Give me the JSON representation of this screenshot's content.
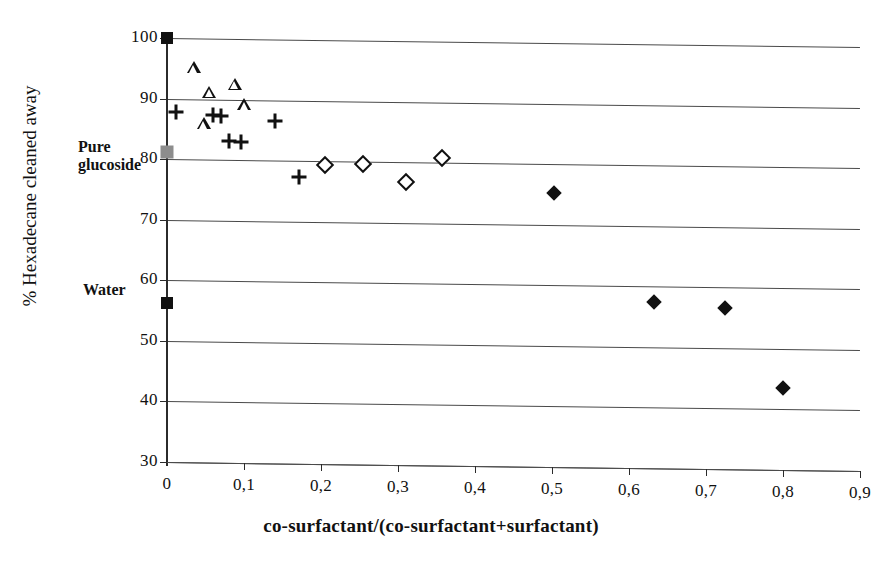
{
  "chart_data": {
    "type": "scatter",
    "title": "",
    "xlabel": "co-surfactant/(co-surfactant+surfactant)",
    "ylabel": "% Hexadecane cleaned away",
    "xlim": [
      0,
      0.9
    ],
    "ylim": [
      30,
      100
    ],
    "grid": true,
    "legend_position": "none",
    "x_tick_labels": [
      "0",
      "0,1",
      "0,2",
      "0,3",
      "0,4",
      "0,5",
      "0,6",
      "0,7",
      "0,8",
      "0,9"
    ],
    "x_tick_values": [
      0,
      0.1,
      0.2,
      0.3,
      0.4,
      0.5,
      0.6,
      0.7,
      0.8,
      0.9
    ],
    "y_tick_labels": [
      "100",
      "90",
      "80",
      "70",
      "60",
      "50",
      "40",
      "30"
    ],
    "y_tick_values": [
      100,
      90,
      80,
      70,
      60,
      50,
      40,
      30
    ],
    "y_tick_note": "The 100 label is partly hidden behind the filled square reference marker at x=0.",
    "series": [
      {
        "name": "open-triangle",
        "marker": "open triangle",
        "points": [
          {
            "x": 0.035,
            "y": 95.2
          },
          {
            "x": 0.055,
            "y": 91.2
          },
          {
            "x": 0.048,
            "y": 86.0
          },
          {
            "x": 0.088,
            "y": 92.6
          },
          {
            "x": 0.1,
            "y": 89.2
          }
        ]
      },
      {
        "name": "plus",
        "marker": "plus sign",
        "points": [
          {
            "x": 0.012,
            "y": 87.8
          },
          {
            "x": 0.06,
            "y": 87.4
          },
          {
            "x": 0.07,
            "y": 87.2
          },
          {
            "x": 0.08,
            "y": 83.2
          },
          {
            "x": 0.096,
            "y": 83.0
          },
          {
            "x": 0.14,
            "y": 86.6
          },
          {
            "x": 0.172,
            "y": 77.4
          }
        ]
      },
      {
        "name": "open-diamond",
        "marker": "open diamond",
        "points": [
          {
            "x": 0.205,
            "y": 79.4
          },
          {
            "x": 0.255,
            "y": 79.6
          },
          {
            "x": 0.31,
            "y": 76.8
          },
          {
            "x": 0.357,
            "y": 80.8
          }
        ]
      },
      {
        "name": "filled-diamond",
        "marker": "filled diamond",
        "points": [
          {
            "x": 0.503,
            "y": 75.2
          },
          {
            "x": 0.633,
            "y": 57.4
          },
          {
            "x": 0.725,
            "y": 56.6
          },
          {
            "x": 0.8,
            "y": 43.6
          }
        ]
      },
      {
        "name": "reference-markers",
        "marker": "square",
        "points": [
          {
            "x": 0.0,
            "y": 100.0,
            "style": "filled black square"
          },
          {
            "x": 0.0,
            "y": 81.2,
            "style": "gray square",
            "label": "Pure glucoside"
          },
          {
            "x": 0.0,
            "y": 56.2,
            "style": "filled black square",
            "label": "Water"
          }
        ]
      }
    ],
    "annotations": [
      {
        "id": "pure-glucoside",
        "text": "Pure\nglucoside",
        "line1": "Pure",
        "line2": "glucoside",
        "at_y": 81.2
      },
      {
        "id": "water",
        "text": "Water",
        "at_y": 56.2
      }
    ]
  },
  "axes": {
    "x_title": "co-surfactant/(co-surfactant+surfactant)",
    "y_title": "% Hexadecane cleaned away"
  },
  "annotations": {
    "pure_line1": "Pure",
    "pure_line2": "glucoside",
    "water": "Water"
  }
}
